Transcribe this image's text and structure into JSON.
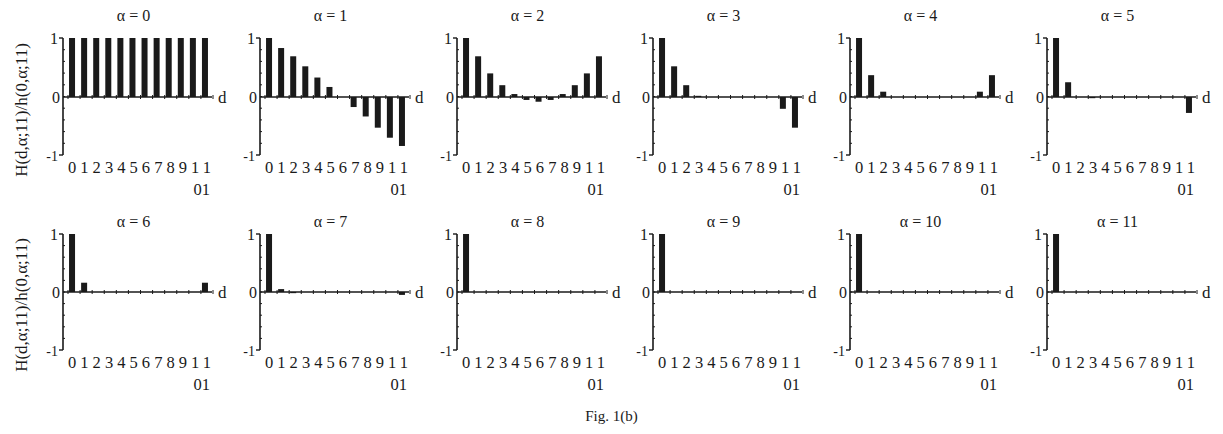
{
  "figure": {
    "caption": "Fig. 1(b)",
    "ylabel": "H(d,α;11)/h(0,α;11)",
    "xlabel": "d",
    "ytick_labels": [
      "1",
      "0",
      "-1"
    ],
    "xtick_line1": "012345678911",
    "xtick_line2": "01",
    "bar_color": "#1a1a1a",
    "axis_color": "#1a1a1a"
  },
  "chart_data": [
    {
      "type": "bar",
      "title": "α = 0",
      "xlabel": "d",
      "ylabel": "H(d,α;11)/h(0,α;11)",
      "ylim": [
        -1,
        1
      ],
      "categories": [
        0,
        1,
        2,
        3,
        4,
        5,
        6,
        7,
        8,
        9,
        10,
        11
      ],
      "values": [
        1,
        1,
        1,
        1,
        1,
        1,
        1,
        1,
        1,
        1,
        1,
        1
      ]
    },
    {
      "type": "bar",
      "title": "α = 1",
      "xlabel": "d",
      "ylabel": "H(d,α;11)/h(0,α;11)",
      "ylim": [
        -1,
        1
      ],
      "categories": [
        0,
        1,
        2,
        3,
        4,
        5,
        6,
        7,
        8,
        9,
        10,
        11
      ],
      "values": [
        1,
        0.83,
        0.69,
        0.52,
        0.33,
        0.17,
        0,
        -0.17,
        -0.33,
        -0.52,
        -0.69,
        -0.83
      ]
    },
    {
      "type": "bar",
      "title": "α = 2",
      "xlabel": "d",
      "ylabel": "H(d,α;11)/h(0,α;11)",
      "ylim": [
        -1,
        1
      ],
      "categories": [
        0,
        1,
        2,
        3,
        4,
        5,
        6,
        7,
        8,
        9,
        10,
        11
      ],
      "values": [
        1,
        0.69,
        0.4,
        0.2,
        0.05,
        -0.05,
        -0.08,
        -0.05,
        0.05,
        0.2,
        0.4,
        0.69
      ]
    },
    {
      "type": "bar",
      "title": "α = 3",
      "xlabel": "d",
      "ylabel": "H(d,α;11)/h(0,α;11)",
      "ylim": [
        -1,
        1
      ],
      "categories": [
        0,
        1,
        2,
        3,
        4,
        5,
        6,
        7,
        8,
        9,
        10,
        11
      ],
      "values": [
        1,
        0.52,
        0.2,
        0.02,
        0.01,
        0,
        0,
        0,
        0.01,
        0.01,
        -0.2,
        -0.52
      ]
    },
    {
      "type": "bar",
      "title": "α = 4",
      "xlabel": "d",
      "ylabel": "H(d,α;11)/h(0,α;11)",
      "ylim": [
        -1,
        1
      ],
      "categories": [
        0,
        1,
        2,
        3,
        4,
        5,
        6,
        7,
        8,
        9,
        10,
        11
      ],
      "values": [
        1,
        0.37,
        0.09,
        0,
        -0.01,
        0,
        0.01,
        0,
        -0.01,
        0,
        0.09,
        0.37
      ]
    },
    {
      "type": "bar",
      "title": "α = 5",
      "xlabel": "d",
      "ylabel": "H(d,α;11)/h(0,α;11)",
      "ylim": [
        -1,
        1
      ],
      "categories": [
        0,
        1,
        2,
        3,
        4,
        5,
        6,
        7,
        8,
        9,
        10,
        11
      ],
      "values": [
        1,
        0.25,
        0,
        -0.02,
        0,
        0,
        0,
        0,
        0,
        0.01,
        0,
        -0.27
      ]
    },
    {
      "type": "bar",
      "title": "α = 6",
      "xlabel": "d",
      "ylabel": "H(d,α;11)/h(0,α;11)",
      "ylim": [
        -1,
        1
      ],
      "categories": [
        0,
        1,
        2,
        3,
        4,
        5,
        6,
        7,
        8,
        9,
        10,
        11
      ],
      "values": [
        1,
        0.16,
        -0.01,
        0,
        0,
        0,
        0,
        0,
        0,
        0,
        -0.01,
        0.16
      ]
    },
    {
      "type": "bar",
      "title": "α = 7",
      "xlabel": "d",
      "ylabel": "H(d,α;11)/h(0,α;11)",
      "ylim": [
        -1,
        1
      ],
      "categories": [
        0,
        1,
        2,
        3,
        4,
        5,
        6,
        7,
        8,
        9,
        10,
        11
      ],
      "values": [
        1,
        0.05,
        -0.02,
        0,
        0,
        0,
        0,
        0,
        0,
        0,
        0.01,
        -0.05
      ]
    },
    {
      "type": "bar",
      "title": "α = 8",
      "xlabel": "d",
      "ylabel": "H(d,α;11)/h(0,α;11)",
      "ylim": [
        -1,
        1
      ],
      "categories": [
        0,
        1,
        2,
        3,
        4,
        5,
        6,
        7,
        8,
        9,
        10,
        11
      ],
      "values": [
        1,
        0.01,
        0,
        0,
        0,
        0,
        0,
        0,
        0,
        0,
        0,
        0.01
      ]
    },
    {
      "type": "bar",
      "title": "α = 9",
      "xlabel": "d",
      "ylabel": "H(d,α;11)/h(0,α;11)",
      "ylim": [
        -1,
        1
      ],
      "categories": [
        0,
        1,
        2,
        3,
        4,
        5,
        6,
        7,
        8,
        9,
        10,
        11
      ],
      "values": [
        1,
        0,
        0,
        0,
        0,
        0,
        0,
        0,
        0,
        0,
        0,
        0
      ]
    },
    {
      "type": "bar",
      "title": "α = 10",
      "xlabel": "d",
      "ylabel": "H(d,α;11)/h(0,α;11)",
      "ylim": [
        -1,
        1
      ],
      "categories": [
        0,
        1,
        2,
        3,
        4,
        5,
        6,
        7,
        8,
        9,
        10,
        11
      ],
      "values": [
        1,
        0,
        0,
        0,
        0,
        0,
        0,
        0,
        0,
        0,
        0,
        0
      ]
    },
    {
      "type": "bar",
      "title": "α = 11",
      "xlabel": "d",
      "ylabel": "H(d,α;11)/h(0,α;11)",
      "ylim": [
        -1,
        1
      ],
      "categories": [
        0,
        1,
        2,
        3,
        4,
        5,
        6,
        7,
        8,
        9,
        10,
        11
      ],
      "values": [
        1,
        0,
        0,
        0,
        0,
        0,
        0,
        0,
        0,
        0,
        0,
        0
      ]
    }
  ],
  "layout": {
    "axis_x": [
      63,
      260,
      457,
      653,
      850,
      1047
    ],
    "rows": [
      {
        "title_y": 21,
        "y_top": 38,
        "y_zero": 97,
        "y_bottom": 155,
        "tick1_y": 173,
        "tick2_y": 195
      },
      {
        "title_y": 227,
        "y_top": 234,
        "y_zero": 292,
        "y_bottom": 350,
        "tick1_y": 368,
        "tick2_y": 390
      }
    ],
    "plot_width": 145,
    "ylabel_rows_center_y": [
      110,
      305
    ]
  }
}
